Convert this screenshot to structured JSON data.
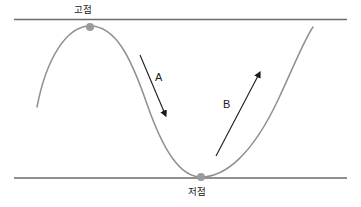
{
  "figure": {
    "kind": "price-cycle-diagram",
    "background_color": "#ffffff",
    "curve_color": "#8f8f94",
    "line_color": "#6b6b6b",
    "marker_color": "#9a9a9f",
    "arrow_color": "#1a1a1a",
    "text_color": "#1a1a1a"
  },
  "labels": {
    "high_point": "고점",
    "low_point": "저점",
    "arrow_a": "A",
    "arrow_b": "B"
  },
  "icons": {
    "high_marker": "circle-marker-icon",
    "low_marker": "circle-marker-icon",
    "arrow_down": "arrow-down-right-icon",
    "arrow_up": "arrow-up-right-icon"
  },
  "chart_data": {
    "type": "line",
    "title": "",
    "xlabel": "",
    "ylabel": "",
    "grid": false,
    "legend": null,
    "xlim": [
      0,
      361
    ],
    "ylim": [
      207,
      0
    ],
    "reference_lines": [
      {
        "name": "high-line",
        "orientation": "horizontal",
        "y": 19.5,
        "x_start": 14,
        "x_end": 347,
        "label": "고점"
      },
      {
        "name": "low-line",
        "orientation": "horizontal",
        "y": 178,
        "x_start": 14,
        "x_end": 347,
        "label": "저점"
      }
    ],
    "series": [
      {
        "name": "price-wave",
        "path": "M 37 107 C 46 60 66 26 90 26 C 116 26 131 58 147 104 C 163 150 180 177 201 177 C 225 177 252 155 278 100 C 294 66 304 40 313 27",
        "points": [
          {
            "x": 37,
            "y": 107
          },
          {
            "x": 90,
            "y": 26
          },
          {
            "x": 201,
            "y": 177
          },
          {
            "x": 313,
            "y": 27
          }
        ]
      }
    ],
    "markers": [
      {
        "name": "high-point-marker",
        "x": 90,
        "y": 27,
        "r": 4,
        "label": "고점"
      },
      {
        "name": "low-point-marker",
        "x": 201,
        "y": 177,
        "r": 4,
        "label": "저점"
      }
    ],
    "annotations": [
      {
        "name": "arrow-a",
        "label": "A",
        "direction": "down-right",
        "x1": 140,
        "y1": 55,
        "x2": 165,
        "y2": 114
      },
      {
        "name": "arrow-b",
        "label": "B",
        "direction": "up-right",
        "x1": 216,
        "y1": 156,
        "x2": 259,
        "y2": 74
      }
    ]
  }
}
